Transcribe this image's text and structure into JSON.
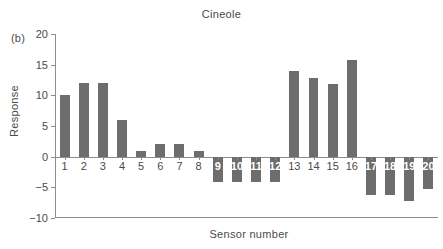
{
  "panel": {
    "label": "(b)"
  },
  "chart_data": {
    "type": "bar",
    "title": "Cineole",
    "xlabel": "Sensor number",
    "ylabel": "Response",
    "categories": [
      "1",
      "2",
      "3",
      "4",
      "5",
      "6",
      "7",
      "8",
      "9",
      "10",
      "11",
      "12",
      "13",
      "14",
      "15",
      "16",
      "17",
      "18",
      "19",
      "20"
    ],
    "values": [
      10.0,
      12.0,
      12.0,
      6.0,
      1.0,
      2.0,
      2.0,
      1.0,
      -4.1,
      -4.1,
      -4.1,
      -4.1,
      13.9,
      12.9,
      11.9,
      15.8,
      -6.2,
      -6.2,
      -7.2,
      -5.3
    ],
    "ylim": [
      -10,
      20
    ],
    "yticks": [
      20,
      15,
      10,
      5,
      0,
      -5,
      -10
    ],
    "ytick_labels": [
      "20",
      "15",
      "10",
      "5",
      "0",
      "−5",
      "−10"
    ],
    "grid": false,
    "legend": null,
    "bar_color": "#6d6d6d",
    "axis_color": "#8c8c8c"
  }
}
